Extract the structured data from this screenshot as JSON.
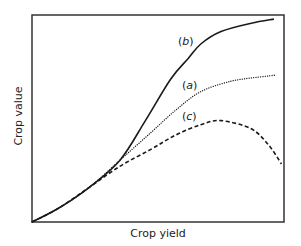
{
  "chart_data": {
    "type": "line",
    "title": "",
    "xlabel": "Crop yield",
    "ylabel": "Crop value",
    "xlim": [
      0,
      100
    ],
    "ylim": [
      0,
      100
    ],
    "grid": false,
    "legend": "none (curves labeled inline)",
    "axis_ticks": "none",
    "series": [
      {
        "name": "(b)",
        "label_letter": "b",
        "style": "solid",
        "x": [
          0,
          11,
          23,
          35,
          45,
          55,
          62,
          67,
          75,
          87,
          96
        ],
        "y": [
          0,
          7,
          17,
          30,
          49,
          69,
          79,
          86,
          92,
          96,
          98
        ]
      },
      {
        "name": "(a)",
        "label_letter": "a",
        "style": "dotted",
        "x": [
          0,
          11,
          23,
          35,
          47,
          57,
          67,
          79,
          90,
          97
        ],
        "y": [
          0,
          7,
          17,
          30,
          43,
          54,
          63,
          68,
          70,
          71
        ]
      },
      {
        "name": "(c)",
        "label_letter": "c",
        "style": "dashed",
        "x": [
          0,
          11,
          23,
          35,
          47,
          57,
          67,
          75,
          87,
          94,
          99
        ],
        "y": [
          0,
          7,
          17,
          27,
          35,
          42,
          47,
          49,
          45,
          37,
          28
        ]
      }
    ],
    "annotations": [
      {
        "text": "(b)",
        "x": 59,
        "y": 87
      },
      {
        "text": "(a)",
        "x": 60,
        "y": 66
      },
      {
        "text": "(c)",
        "x": 60,
        "y": 51
      }
    ]
  },
  "labels": {
    "xlabel": "Crop yield",
    "ylabel": "Crop value",
    "b_open": "(",
    "b_letter": "b",
    "b_close": ")",
    "a_open": "(",
    "a_letter": "a",
    "a_close": ")",
    "c_open": "(",
    "c_letter": "c",
    "c_close": ")"
  },
  "colors": {
    "line": "#1a1a1a",
    "frame": "#333333",
    "background": "#ffffff"
  }
}
